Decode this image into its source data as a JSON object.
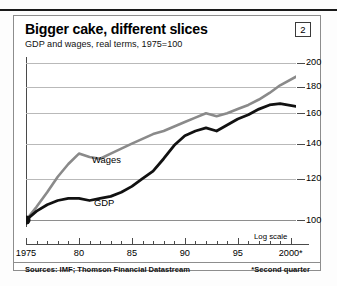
{
  "header": {
    "title": "Bigger cake, different slices",
    "subtitle": "GDP and wages, real terms, 1975=100",
    "chart_number": "2"
  },
  "footer": {
    "sources": "Sources: IMF; Thomson Financial Datastream",
    "note": "*Second quarter"
  },
  "axis": {
    "log_scale_label": "Log scale",
    "y_ticks": [
      "200",
      "180",
      "160",
      "140",
      "120",
      "100"
    ],
    "x_ticks": [
      "1975",
      "80",
      "85",
      "90",
      "95",
      "2000*"
    ]
  },
  "legend": {
    "wages": "Wages",
    "gdp": "GDP"
  },
  "colors": {
    "wages": "#8a8a8a",
    "gdp": "#111111",
    "grid": "#b9b9b9",
    "frame": "#8d8d8d"
  },
  "chart_data": {
    "type": "line",
    "title": "Bigger cake, different slices",
    "subtitle": "GDP and wages, real terms, 1975=100",
    "xlabel": "",
    "ylabel": "Index, 1975=100",
    "yscale": "log",
    "ylim": [
      97,
      205
    ],
    "xlim": [
      1975,
      2000.5
    ],
    "grid": true,
    "gridlines": [
      100,
      120,
      140,
      160,
      180,
      200
    ],
    "legend_position": "inline",
    "annotations": [
      "Log scale",
      "*Second quarter"
    ],
    "x": [
      1975,
      1976,
      1977,
      1978,
      1979,
      1980,
      1981,
      1982,
      1983,
      1984,
      1985,
      1986,
      1987,
      1988,
      1989,
      1990,
      1991,
      1992,
      1993,
      1994,
      1995,
      1996,
      1997,
      1998,
      1999,
      2000.5
    ],
    "series": [
      {
        "name": "Wages",
        "color": "#8a8a8a",
        "values": [
          100,
          106,
          113,
          121,
          128,
          134,
          132,
          131,
          134,
          137,
          140,
          143,
          146,
          148,
          151,
          154,
          157,
          160,
          158,
          160,
          163,
          166,
          170,
          175,
          181,
          188
        ]
      },
      {
        "name": "GDP",
        "color": "#111111",
        "values": [
          100,
          104,
          107,
          109,
          110,
          110,
          109,
          110,
          111,
          113,
          116,
          120,
          124,
          131,
          139,
          145,
          148,
          150,
          148,
          152,
          156,
          159,
          163,
          166,
          167,
          165
        ]
      }
    ],
    "start_marker": {
      "x": 1975,
      "y": 100,
      "color": "#111111"
    }
  }
}
